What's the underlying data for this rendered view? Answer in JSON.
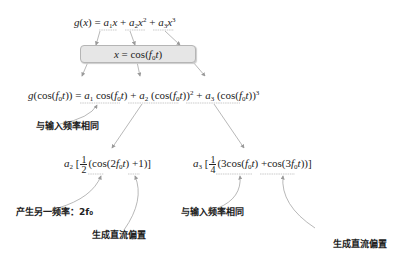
{
  "diagram": {
    "top_formula": {
      "lhs": "g(x) =",
      "terms": [
        "a1 x",
        "a2 x^2",
        "a3 x^3"
      ],
      "display": "g(x) = a₁x + a₂x² + a₃x³"
    },
    "substitution_box": {
      "label": "x = cos(f₀t)"
    },
    "expanded_formula": {
      "lhs": "g(cos(f₀t)) =",
      "terms": [
        "a₁ cos(f₀t)",
        "a₂ (cos(f₀t))²",
        "a₃ (cos(f₀t))³"
      ],
      "display": "g(cos(f₀t)) = a₁ cos(f₀t) + a₂ (cos(f₀t))² + a₃ (cos(f₀t))³"
    },
    "second_order_expansion": {
      "display": "a₂[½(cos(2f₀t) +1)]",
      "coefficient": "a₂",
      "fraction": {
        "num": "1",
        "den": "2"
      },
      "terms": [
        "cos(2f₀t)",
        "+1"
      ]
    },
    "third_order_expansion": {
      "display": "a₃[¼(3cos(f₀t) +cos(3f₀t))]",
      "coefficient": "a₃",
      "fraction": {
        "num": "1",
        "den": "4"
      },
      "terms": [
        "3cos(f₀t)",
        "+cos(3f₀t)"
      ]
    },
    "annotations": {
      "same_freq_1": "与输入频率相同",
      "new_freq": "产生另一频率：2f₀",
      "dc_bias_1": "生成直流偏置",
      "same_freq_2": "与输入频率相同",
      "dc_bias_2": "生成直流偏置"
    },
    "colors": {
      "text": "#222222",
      "arrow": "#9a9a9a",
      "box_fill": "#e6e6e6",
      "box_border": "#b5b5b5",
      "underline": "#a8a8a8"
    }
  }
}
